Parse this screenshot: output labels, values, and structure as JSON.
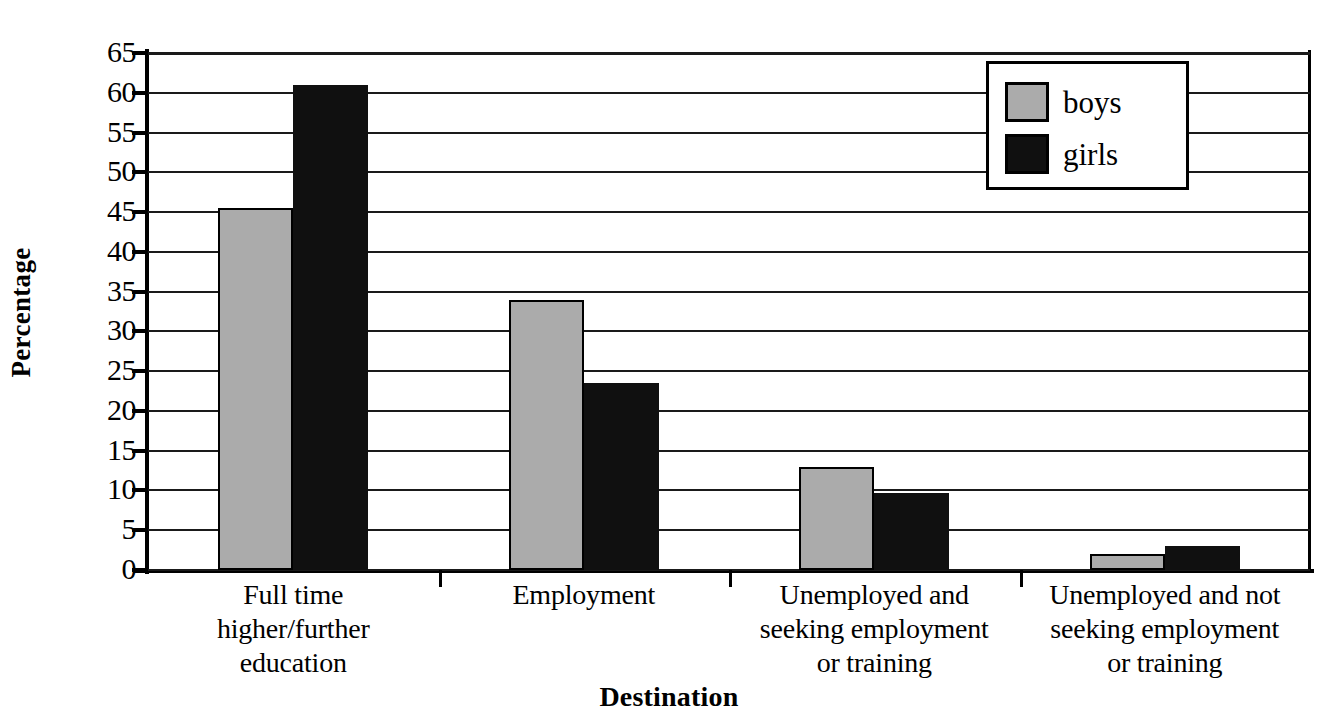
{
  "chart_data": {
    "type": "bar",
    "title": "",
    "xlabel": "Destination",
    "ylabel": "Percentage",
    "ylim": [
      0,
      65
    ],
    "ytick_step": 5,
    "yticks": [
      65,
      60,
      55,
      50,
      45,
      40,
      35,
      30,
      25,
      20,
      15,
      10,
      5,
      0
    ],
    "grid": true,
    "legend_position": "top-right",
    "categories": [
      "Full time higher/further education",
      "Employment",
      "Unemployed and seeking employment or training",
      "Unemployed and not seeking employment or training"
    ],
    "category_lines": [
      [
        "Full time",
        "higher/further",
        "education"
      ],
      [
        "Employment"
      ],
      [
        "Unemployed and",
        "seeking employment",
        "or training"
      ],
      [
        "Unemployed and not",
        "seeking employment",
        "or training"
      ]
    ],
    "series": [
      {
        "name": "boys",
        "color": "#ababab",
        "values": [
          45.5,
          34.0,
          13.0,
          2.0
        ]
      },
      {
        "name": "girls",
        "color": "#101010",
        "values": [
          61.0,
          23.5,
          9.7,
          3.0
        ]
      }
    ]
  },
  "axes": {
    "y_title": "Percentage",
    "x_title": "Destination"
  },
  "legend": {
    "entries": [
      {
        "label": "boys",
        "swatch_color": "#ababab"
      },
      {
        "label": "girls",
        "swatch_color": "#101010"
      }
    ]
  },
  "ytick_labels": [
    "65",
    "60",
    "55",
    "50",
    "45",
    "40",
    "35",
    "30",
    "25",
    "20",
    "15",
    "10",
    "5",
    "0"
  ],
  "colors": {
    "boys": "#ababab",
    "girls": "#101010",
    "axis": "#000000",
    "background": "#ffffff"
  }
}
